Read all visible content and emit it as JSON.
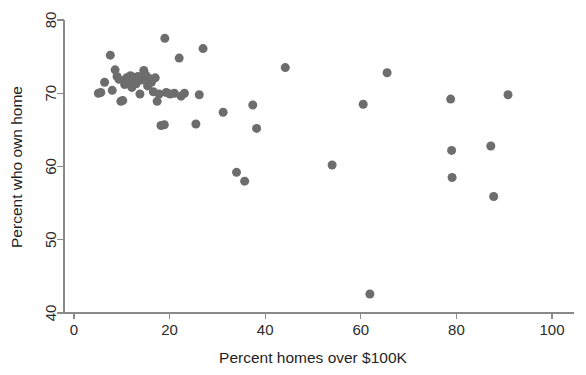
{
  "chart_data": {
    "type": "scatter",
    "title": "",
    "subtitle": "",
    "xlabel": "Percent homes over $100K",
    "ylabel": "Percent who own home",
    "xlim": [
      0,
      100
    ],
    "ylim": [
      40,
      80
    ],
    "xticks": [
      0,
      20,
      40,
      60,
      80,
      100
    ],
    "yticks": [
      40,
      50,
      60,
      70,
      80
    ],
    "xticklabels": [
      "0",
      "20",
      "40",
      "60",
      "80",
      "100"
    ],
    "yticklabels": [
      "40",
      "50",
      "60",
      "70",
      "80"
    ],
    "grid": false,
    "legend": false,
    "legend_position": "none",
    "marker_color": "#6d6d6d",
    "marker_size": 9,
    "axis_color": "#8a8a8a",
    "background": "#ffffff",
    "n_points": 55,
    "points": [
      {
        "x": 5.1,
        "y": 70.0
      },
      {
        "x": 5.6,
        "y": 70.1
      },
      {
        "x": 6.4,
        "y": 71.5
      },
      {
        "x": 7.6,
        "y": 75.2
      },
      {
        "x": 8.0,
        "y": 70.4
      },
      {
        "x": 8.6,
        "y": 73.2
      },
      {
        "x": 9.0,
        "y": 72.3
      },
      {
        "x": 9.4,
        "y": 71.9
      },
      {
        "x": 9.8,
        "y": 68.9
      },
      {
        "x": 10.2,
        "y": 69.0
      },
      {
        "x": 10.6,
        "y": 71.2
      },
      {
        "x": 11.0,
        "y": 72.1
      },
      {
        "x": 11.4,
        "y": 71.6
      },
      {
        "x": 11.8,
        "y": 72.4
      },
      {
        "x": 12.1,
        "y": 70.8
      },
      {
        "x": 12.6,
        "y": 72.2
      },
      {
        "x": 13.0,
        "y": 71.3
      },
      {
        "x": 13.4,
        "y": 72.3
      },
      {
        "x": 13.8,
        "y": 69.9
      },
      {
        "x": 14.2,
        "y": 71.8
      },
      {
        "x": 14.6,
        "y": 73.1
      },
      {
        "x": 15.0,
        "y": 72.5
      },
      {
        "x": 15.4,
        "y": 71.0
      },
      {
        "x": 15.8,
        "y": 72.0
      },
      {
        "x": 16.2,
        "y": 71.5
      },
      {
        "x": 16.6,
        "y": 70.2
      },
      {
        "x": 17.0,
        "y": 72.1
      },
      {
        "x": 17.4,
        "y": 68.9
      },
      {
        "x": 17.8,
        "y": 69.9
      },
      {
        "x": 18.2,
        "y": 65.6
      },
      {
        "x": 18.9,
        "y": 65.7
      },
      {
        "x": 19.0,
        "y": 77.5
      },
      {
        "x": 19.3,
        "y": 70.1
      },
      {
        "x": 20.1,
        "y": 69.9
      },
      {
        "x": 21.0,
        "y": 70.0
      },
      {
        "x": 22.0,
        "y": 74.8
      },
      {
        "x": 22.4,
        "y": 69.6
      },
      {
        "x": 23.1,
        "y": 70.0
      },
      {
        "x": 25.5,
        "y": 65.8
      },
      {
        "x": 26.2,
        "y": 69.8
      },
      {
        "x": 27.0,
        "y": 76.1
      },
      {
        "x": 31.2,
        "y": 67.4
      },
      {
        "x": 34.0,
        "y": 59.2
      },
      {
        "x": 35.7,
        "y": 58.0
      },
      {
        "x": 37.4,
        "y": 68.4
      },
      {
        "x": 38.2,
        "y": 65.2
      },
      {
        "x": 44.2,
        "y": 73.5
      },
      {
        "x": 54.0,
        "y": 60.2
      },
      {
        "x": 60.5,
        "y": 68.5
      },
      {
        "x": 61.9,
        "y": 42.6
      },
      {
        "x": 65.5,
        "y": 72.8
      },
      {
        "x": 78.8,
        "y": 69.2
      },
      {
        "x": 79.0,
        "y": 62.2
      },
      {
        "x": 79.1,
        "y": 58.5
      },
      {
        "x": 87.2,
        "y": 62.8
      },
      {
        "x": 87.8,
        "y": 55.9
      },
      {
        "x": 90.8,
        "y": 69.8
      }
    ]
  }
}
